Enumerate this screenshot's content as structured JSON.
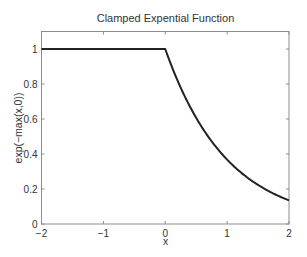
{
  "chart_data": {
    "type": "line",
    "title": "Clamped Expential Function",
    "xlabel": "x",
    "ylabel": "exp(−max(x,0))",
    "xlim": [
      -2,
      2
    ],
    "ylim": [
      0,
      1.1
    ],
    "xticks": [
      -2,
      -1,
      0,
      1,
      2
    ],
    "xtick_labels": [
      "−2",
      "−1",
      "0",
      "1",
      "2"
    ],
    "yticks": [
      0,
      0.2,
      0.4,
      0.6,
      0.8,
      1
    ],
    "ytick_labels": [
      "0",
      "0.2",
      "0.4",
      "0.6",
      "0.8",
      "1"
    ],
    "grid": false,
    "legend": null,
    "series": [
      {
        "name": "exp(-max(x,0))",
        "color": "#222222",
        "x": [
          -2,
          -1.5,
          -1,
          -0.5,
          0,
          0.25,
          0.5,
          0.75,
          1,
          1.25,
          1.5,
          1.75,
          2
        ],
        "y": [
          1,
          1,
          1,
          1,
          1,
          0.7788,
          0.6065,
          0.4724,
          0.3679,
          0.2865,
          0.2231,
          0.1738,
          0.1353
        ]
      }
    ]
  },
  "colors": {
    "axes": "#8c8c8c",
    "line": "#222222",
    "text": "#333333"
  }
}
